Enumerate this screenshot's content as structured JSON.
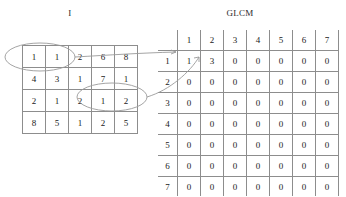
{
  "figure": {
    "image_matrix_title": "I",
    "glcm_title": "GLCM"
  },
  "image_matrix": {
    "name": "I",
    "rows": 4,
    "cols": 5,
    "values": [
      [
        1,
        1,
        2,
        6,
        8
      ],
      [
        4,
        3,
        1,
        7,
        1
      ],
      [
        2,
        1,
        2,
        1,
        2
      ],
      [
        8,
        5,
        1,
        2,
        5
      ]
    ]
  },
  "glcm": {
    "corner_label": "",
    "col_headers": [
      "1",
      "2",
      "3",
      "4",
      "5",
      "6",
      "7"
    ],
    "row_headers": [
      "1",
      "2",
      "3",
      "4",
      "5",
      "6",
      "7"
    ],
    "values": [
      [
        1,
        3,
        0,
        0,
        0,
        0,
        0
      ],
      [
        0,
        0,
        0,
        0,
        0,
        0,
        0
      ],
      [
        0,
        0,
        0,
        0,
        0,
        0,
        0
      ],
      [
        0,
        0,
        0,
        0,
        0,
        0,
        0
      ],
      [
        0,
        0,
        0,
        0,
        0,
        0,
        0
      ],
      [
        0,
        0,
        0,
        0,
        0,
        0,
        0
      ],
      [
        0,
        0,
        0,
        0,
        0,
        0,
        0
      ]
    ]
  },
  "annotations": {
    "highlight_ellipses": [
      {
        "label": "pixel-pair-1-1",
        "cells": "row1 col1-col2",
        "values": [
          1,
          1
        ]
      },
      {
        "label": "pixel-pair-1-2",
        "cells": "row3 col4-col5",
        "values": [
          1,
          2
        ]
      }
    ],
    "connectors": [
      {
        "from": "pixel-pair-1-1",
        "to": "glcm cell (1,1)"
      },
      {
        "from": "pixel-pair-1-2",
        "to": "glcm cell (1,2)"
      }
    ],
    "stroke_color": "#9a9a9a"
  }
}
